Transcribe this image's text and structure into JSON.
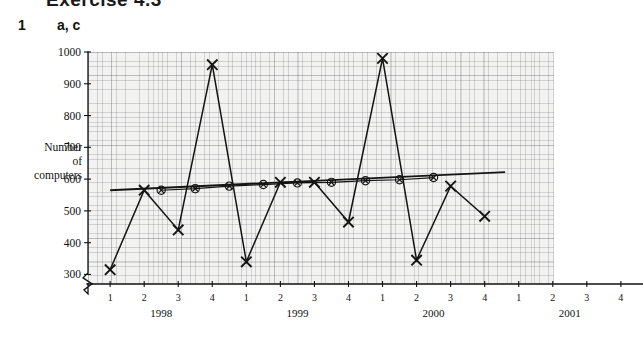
{
  "header": {
    "cut_off_title": "Exercise 4.3",
    "question_number": "1",
    "question_parts": "a, c"
  },
  "axis_titles": {
    "y_line1": "Number",
    "y_line2": "of",
    "y_line3": "computers"
  },
  "chart_data": {
    "type": "line",
    "title": "",
    "xlabel": "",
    "ylabel": "Number of computers",
    "ylim": [
      270,
      1000
    ],
    "yticks": [
      300,
      400,
      500,
      600,
      700,
      800,
      900,
      1000
    ],
    "ytick_labels": [
      "300",
      "400",
      "500",
      "600",
      "700",
      "800",
      "900",
      "1000"
    ],
    "y_axis_break": true,
    "grid": true,
    "grid_style": "graph-paper",
    "legend_position": "none",
    "x_quarter_labels": [
      "1",
      "2",
      "3",
      "4",
      "1",
      "2",
      "3",
      "4",
      "1",
      "2",
      "3",
      "4",
      "1",
      "2",
      "3",
      "4"
    ],
    "x_year_groups": [
      "1998",
      "1999",
      "2000",
      "2001"
    ],
    "x_quarters_per_year": 4,
    "x": [
      1,
      2,
      3,
      4,
      5,
      6,
      7,
      8,
      9,
      10,
      11,
      12
    ],
    "x_tick_index_of_points": [
      1,
      2,
      3,
      4,
      5,
      6,
      7,
      8,
      9,
      10,
      11,
      12
    ],
    "series": [
      {
        "name": "Number of computers (quarterly)",
        "marker": "cross",
        "values": [
          315,
          565,
          440,
          960,
          340,
          590,
          590,
          465,
          980,
          345,
          578,
          483
        ]
      },
      {
        "name": "4-point moving average",
        "marker": "circled-cross",
        "values": [
          null,
          565,
          570,
          578,
          583,
          588,
          590,
          595,
          598,
          605,
          null,
          null
        ],
        "plot_x_offset": 0.5,
        "plot_x": [
          2.5,
          3.5,
          4.5,
          5.5,
          6.5,
          7.5,
          8.5,
          9.5,
          10.5
        ]
      },
      {
        "name": "Trend line",
        "marker": "none",
        "line_from": {
          "x": 1.0,
          "y": 565
        },
        "line_to": {
          "x": 12.6,
          "y": 622
        }
      }
    ],
    "annotations": []
  }
}
